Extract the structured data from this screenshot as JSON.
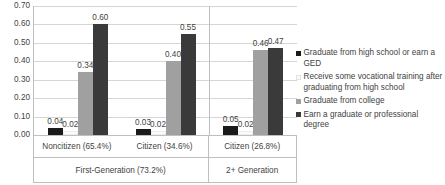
{
  "chart_data": {
    "type": "bar",
    "title": "",
    "xlabel": "",
    "ylabel": "",
    "ylim": [
      0,
      0.7
    ],
    "ytick_labels": [
      "0.70",
      "0.60",
      "0.50",
      "0.40",
      "0.30",
      "0.20",
      "0.10",
      "0.00"
    ],
    "ytick_values": [
      0.7,
      0.6,
      0.5,
      0.4,
      0.3,
      0.2,
      0.1,
      0.0
    ],
    "grid": true,
    "legend_position": "right",
    "axis_title_fragment": "r",
    "categories": [
      "Noncitizen (65.4%)",
      "Citizen (34.6%)",
      "Citizen (26.8%)"
    ],
    "supercategories": [
      {
        "label": "First-Generation (73.2%)",
        "span": 2
      },
      {
        "label": "2+ Generation",
        "span": 1
      }
    ],
    "series": [
      {
        "name": "Graduate from high school or earn a GED",
        "color": "#1a1a1a",
        "values": [
          0.04,
          0.03,
          0.05
        ],
        "labels": [
          "0.04",
          "0.03",
          "0.05"
        ]
      },
      {
        "name": "Receive some vocational training after graduating from high school",
        "color": "#fbfbfb",
        "values": [
          0.02,
          0.02,
          0.02
        ],
        "labels": [
          "0.02",
          "0.02",
          "0.02"
        ]
      },
      {
        "name": "Graduate from college",
        "color": "#a0a0a0",
        "values": [
          0.34,
          0.4,
          0.46
        ],
        "labels": [
          "0.34",
          "0.40",
          "0.46"
        ]
      },
      {
        "name": "Earn a graduate or professional degree",
        "color": "#3a3a3a",
        "values": [
          0.6,
          0.55,
          0.47
        ],
        "labels": [
          "0.60",
          "0.55",
          "0.47"
        ]
      }
    ]
  }
}
